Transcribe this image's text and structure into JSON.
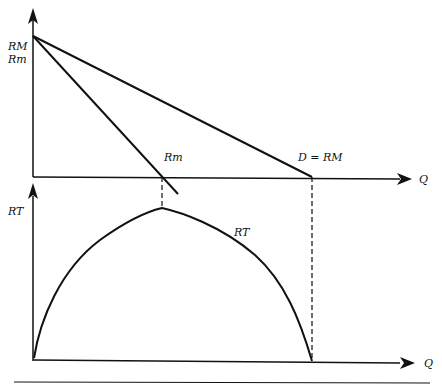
{
  "diagram": {
    "colors": {
      "line": "#111111",
      "background": "#ffffff"
    },
    "upper_panel": {
      "y_axis_label_1": "RM",
      "y_axis_label_2": "Rm",
      "x_axis_label": "Q",
      "demand_label": "D = RM",
      "marginal_label": "Rm"
    },
    "lower_panel": {
      "y_axis_label": "RT",
      "x_axis_label": "Q",
      "curve_label": "RT"
    }
  }
}
